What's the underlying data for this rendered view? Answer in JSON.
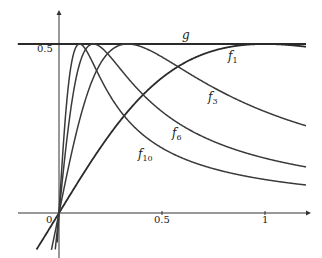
{
  "chart_data": {
    "type": "line",
    "title": "",
    "xlabel": "",
    "ylabel": "",
    "xlim": [
      -0.2,
      1.2
    ],
    "ylim": [
      -0.1,
      0.55
    ],
    "grid": false,
    "x_ticks": [
      {
        "value": 0,
        "label": "0"
      },
      {
        "value": 0.5,
        "label": "0.5"
      },
      {
        "value": 1,
        "label": "1"
      }
    ],
    "y_ticks": [
      {
        "value": 0.5,
        "label": "0.5"
      }
    ],
    "series": [
      {
        "name": "g",
        "label": "g",
        "formula": "g(x) = 0.5",
        "peak": [
          0,
          0.5
        ],
        "value_at_x_1.2": 0.5
      },
      {
        "name": "f1",
        "label": "f",
        "subscript": "1",
        "formula": "n x / (1 + n^2 x^2), n=1",
        "n": 1,
        "peak": [
          1.0,
          0.5
        ],
        "value_at_x_1.2": 0.492
      },
      {
        "name": "f3",
        "label": "f",
        "subscript": "3",
        "formula": "n x / (1 + n^2 x^2), n=3",
        "n": 3,
        "peak": [
          0.333,
          0.5
        ],
        "value_at_x_1.2": 0.258
      },
      {
        "name": "f6",
        "label": "f",
        "subscript": "6",
        "formula": "n x / (1 + n^2 x^2), n=6",
        "n": 6,
        "peak": [
          0.167,
          0.5
        ],
        "value_at_x_1.2": 0.136
      },
      {
        "name": "f10",
        "label": "f",
        "subscript": "10",
        "formula": "n x / (1 + n^2 x^2), n=10",
        "n": 10,
        "peak": [
          0.1,
          0.5
        ],
        "value_at_x_1.2": 0.083
      }
    ],
    "legend": "inline curve labels"
  },
  "labels": {
    "g": "g",
    "f1_base": "f",
    "f1_sub": "1",
    "f3_base": "f",
    "f3_sub": "3",
    "f6_base": "f",
    "f6_sub": "6",
    "f10_base": "f",
    "f10_sub": "10",
    "y_tick_half": "0.5",
    "x_tick_zero": "0",
    "x_tick_half": "0.5",
    "x_tick_one": "1"
  },
  "colors": {
    "curve": "#3a3a3a",
    "axis": "#333333",
    "background": "#ffffff"
  }
}
